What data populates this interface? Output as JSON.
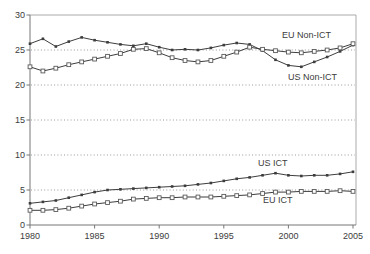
{
  "chart_data": {
    "type": "line",
    "title": "",
    "xlabel": "",
    "ylabel": "",
    "xlim": [
      1980,
      2005
    ],
    "ylim": [
      0,
      30
    ],
    "x_ticks": [
      1980,
      1985,
      1990,
      1995,
      2000,
      2005
    ],
    "y_ticks": [
      0,
      5,
      10,
      15,
      20,
      25,
      30
    ],
    "grid": {
      "horizontal_dotted_at": [
        5,
        10,
        15,
        20,
        25
      ]
    },
    "legend_position": "in-plot text annotations",
    "x": [
      1980,
      1981,
      1982,
      1983,
      1984,
      1985,
      1986,
      1987,
      1988,
      1989,
      1990,
      1991,
      1992,
      1993,
      1994,
      1995,
      1996,
      1997,
      1998,
      1999,
      2000,
      2001,
      2002,
      2003,
      2004,
      2005
    ],
    "series": [
      {
        "name": "US Non-ICT",
        "marker": "filled-square",
        "values": [
          25.9,
          26.6,
          25.5,
          26.2,
          26.8,
          26.4,
          26.1,
          25.8,
          25.6,
          25.9,
          25.4,
          25.0,
          25.1,
          25.0,
          25.3,
          25.7,
          26.0,
          25.8,
          24.9,
          23.6,
          22.8,
          22.6,
          23.3,
          24.0,
          24.8,
          25.7
        ]
      },
      {
        "name": "EU Non-ICT",
        "marker": "open-square",
        "values": [
          22.6,
          22.0,
          22.4,
          22.9,
          23.3,
          23.7,
          24.1,
          24.5,
          25.1,
          25.2,
          24.6,
          23.9,
          23.5,
          23.3,
          23.5,
          24.1,
          24.7,
          25.4,
          25.1,
          24.9,
          24.7,
          24.6,
          24.8,
          25.0,
          25.3,
          25.9
        ]
      },
      {
        "name": "US ICT",
        "marker": "filled-square",
        "values": [
          3.1,
          3.3,
          3.5,
          3.9,
          4.3,
          4.7,
          5.0,
          5.1,
          5.2,
          5.3,
          5.4,
          5.5,
          5.6,
          5.8,
          6.0,
          6.3,
          6.6,
          6.8,
          7.1,
          7.4,
          7.1,
          7.0,
          7.1,
          7.1,
          7.3,
          7.6
        ]
      },
      {
        "name": "EU ICT",
        "marker": "open-square",
        "values": [
          2.1,
          2.1,
          2.2,
          2.4,
          2.7,
          3.0,
          3.2,
          3.4,
          3.7,
          3.8,
          3.9,
          3.9,
          4.0,
          4.0,
          4.0,
          4.1,
          4.2,
          4.3,
          4.5,
          4.7,
          4.7,
          4.8,
          4.8,
          4.8,
          4.9,
          4.8
        ]
      }
    ],
    "annotations": [
      {
        "text": "EU Non-ICT",
        "px": [
          282,
          38
        ]
      },
      {
        "text": "US Non-ICT",
        "px": [
          288,
          80
        ]
      },
      {
        "text": "US ICT",
        "px": [
          258,
          166
        ]
      },
      {
        "text": "EU ICT",
        "px": [
          263,
          203
        ]
      }
    ],
    "colors": {
      "background": "#ffffff",
      "line": "#3d3d3d",
      "open_marker_stroke": "#5a5a5a",
      "open_marker_fill": "#ffffff",
      "axis": "#777777",
      "frame": "#aaaaaa",
      "grid": "#999999",
      "text": "#3c3c3c"
    }
  }
}
